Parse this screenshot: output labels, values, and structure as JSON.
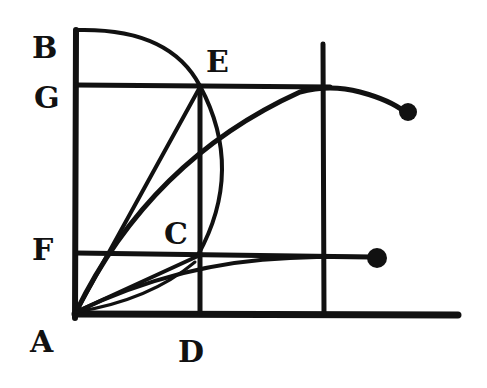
{
  "diagram": {
    "labels": {
      "A": "A",
      "B": "B",
      "C": "C",
      "D": "D",
      "E": "E",
      "F": "F",
      "G": "G"
    },
    "colors": {
      "ink": "#111111",
      "paper": "#ffffff"
    }
  }
}
